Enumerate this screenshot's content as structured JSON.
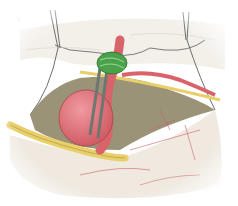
{
  "figure": {
    "panel_label": "A",
    "colors": {
      "brain_surface": "#efe9e0",
      "retracted_tissue": "#f2efea",
      "deep_cavity": "#8c8468",
      "artery": "#d9636a",
      "aneurysm_dome": "#e07b80",
      "nerve_yellow": "#e8cf6a",
      "clip_green": "#4aa24a",
      "clip_metal": "#6b7770",
      "vessel_lines": "#cf4d55"
    }
  }
}
